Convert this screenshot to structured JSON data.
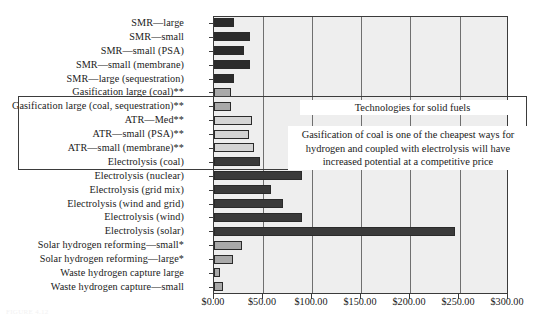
{
  "chart_data": {
    "type": "bar",
    "orientation": "horizontal",
    "title": "",
    "xlabel": "",
    "ylabel": "",
    "xlim": [
      0,
      300
    ],
    "xticks": [
      0,
      50,
      100,
      150,
      200,
      250,
      300
    ],
    "xtick_labels": [
      "$0.00",
      "$50.00",
      "$100.00",
      "$150.00",
      "$200.00",
      "$250.00",
      "$300.00"
    ],
    "grid": true,
    "legend": "none",
    "categories": [
      "SMR—large",
      "SMR—small",
      "SMR—small (PSA)",
      "SMR—small (membrane)",
      "SMR—large (sequestration)",
      "Gasification large (coal)**",
      "Gasification large (coal, sequestration)**",
      "ATR—Med**",
      "ATR—small (PSA)**",
      "ATR—small (membrane)**",
      "Electrolysis (coal)",
      "Electrolysis (nuclear)",
      "Electrolysis (grid mix)",
      "Electrolysis (wind and grid)",
      "Electrolysis (wind)",
      "Electrolysis (solar)",
      "Solar hydrogen reforming—small*",
      "Solar hydrogen reforming—large*",
      "Waste hydrogen capture large",
      "Waste hydrogen capture—small"
    ],
    "values": [
      20,
      37,
      31,
      37,
      20,
      17,
      17,
      39,
      36,
      41,
      47,
      90,
      58,
      70,
      90,
      246,
      29,
      19,
      6,
      9
    ],
    "bar_colors": [
      "#2b2b2b",
      "#2b2b2b",
      "#2b2b2b",
      "#2b2b2b",
      "#2b2b2b",
      "#a9a9a9",
      "#a9a9a9",
      "#d4d4d4",
      "#d4d4d4",
      "#d4d4d4",
      "#3a3a3a",
      "#3a3a3a",
      "#3a3a3a",
      "#3a3a3a",
      "#3a3a3a",
      "#3a3a3a",
      "#a9a9a9",
      "#a9a9a9",
      "#a9a9a9",
      "#a9a9a9"
    ],
    "annotations": [
      {
        "name": "solid-fuels-heading",
        "text": "Technologies for solid fuels"
      },
      {
        "name": "gasification-note",
        "text": "Gasification of coal is one of the cheapest ways for hydrogen and coupled with electrolysis will have increased potential at a competitive price"
      }
    ]
  },
  "colors": {
    "plot_background": "#eeeeee",
    "axis_line": "#3b3b3b",
    "gridline": "#6f6f6f",
    "dark_bar": "#2b2b2b",
    "mid_bar": "#a9a9a9",
    "light_bar": "#d4d4d4"
  },
  "caption": {
    "text": "FIGURE 4.12"
  }
}
